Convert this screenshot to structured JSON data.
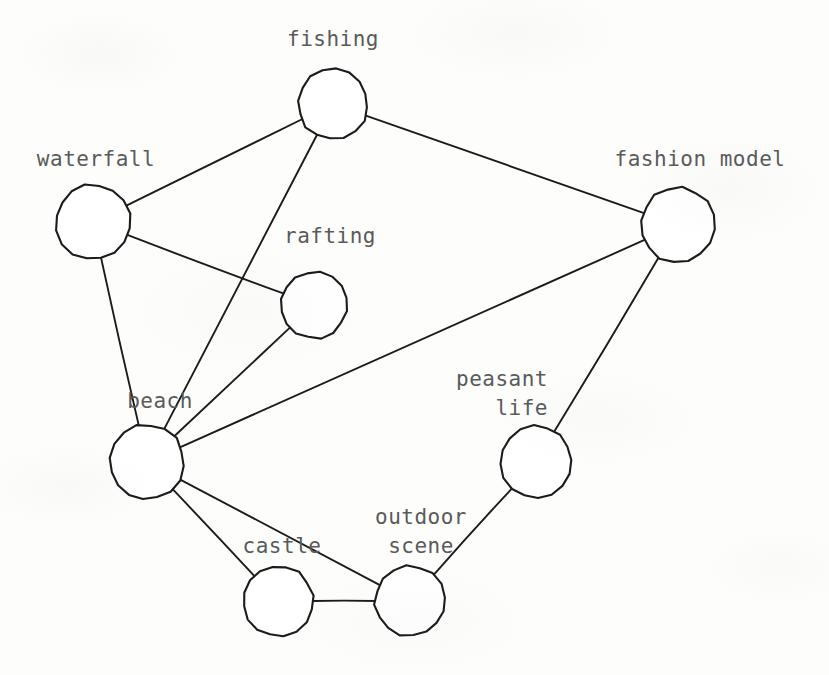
{
  "diagram": {
    "type": "undirected node-link graph",
    "title": "",
    "background_color": "#fdfdfc",
    "stroke_color": "#1b1b1b",
    "label_color": "#5a5a5a",
    "node_fill": "#ffffff",
    "canvas": {
      "width": 829,
      "height": 675
    }
  },
  "nodes": [
    {
      "id": "fishing",
      "label": "fishing",
      "cx": 333,
      "cy": 104,
      "r": 35,
      "label_lines": [
        "fishing"
      ],
      "label_x": 333,
      "label_y": 25,
      "label_align": "center"
    },
    {
      "id": "waterfall",
      "label": "waterfall",
      "cx": 93,
      "cy": 222,
      "r": 37,
      "label_lines": [
        "waterfall"
      ],
      "label_x": 96,
      "label_y": 145,
      "label_align": "center"
    },
    {
      "id": "fashion_model",
      "label": "fashion model",
      "cx": 678,
      "cy": 225,
      "r": 37,
      "label_lines": [
        "fashion model"
      ],
      "label_x": 700,
      "label_y": 145,
      "label_align": "center"
    },
    {
      "id": "rafting",
      "label": "rafting",
      "cx": 314,
      "cy": 305,
      "r": 33,
      "label_lines": [
        "rafting"
      ],
      "label_x": 330,
      "label_y": 222,
      "label_align": "center"
    },
    {
      "id": "beach",
      "label": "beach",
      "cx": 147,
      "cy": 462,
      "r": 37,
      "label_lines": [
        "beach"
      ],
      "label_x": 160,
      "label_y": 387,
      "label_align": "center"
    },
    {
      "id": "peasant_life",
      "label": "peasant life",
      "cx": 536,
      "cy": 462,
      "r": 36,
      "label_lines": [
        "peasant",
        "life"
      ],
      "label_x": 548,
      "label_y": 365,
      "label_align": "right"
    },
    {
      "id": "castle",
      "label": "castle",
      "cx": 278,
      "cy": 601,
      "r": 35,
      "label_lines": [
        "castle"
      ],
      "label_x": 282,
      "label_y": 532,
      "label_align": "center"
    },
    {
      "id": "outdoor_scene",
      "label": "outdoor scene",
      "cx": 410,
      "cy": 601,
      "r": 35,
      "label_lines": [
        "outdoor",
        "scene"
      ],
      "label_x": 421,
      "label_y": 503,
      "label_align": "center"
    }
  ],
  "edges": [
    {
      "source": "waterfall",
      "target": "fishing"
    },
    {
      "source": "fishing",
      "target": "fashion_model"
    },
    {
      "source": "fishing",
      "target": "beach"
    },
    {
      "source": "waterfall",
      "target": "rafting"
    },
    {
      "source": "waterfall",
      "target": "beach"
    },
    {
      "source": "rafting",
      "target": "beach"
    },
    {
      "source": "fashion_model",
      "target": "beach"
    },
    {
      "source": "fashion_model",
      "target": "peasant_life"
    },
    {
      "source": "beach",
      "target": "castle"
    },
    {
      "source": "beach",
      "target": "outdoor_scene"
    },
    {
      "source": "castle",
      "target": "outdoor_scene"
    },
    {
      "source": "peasant_life",
      "target": "outdoor_scene"
    }
  ]
}
